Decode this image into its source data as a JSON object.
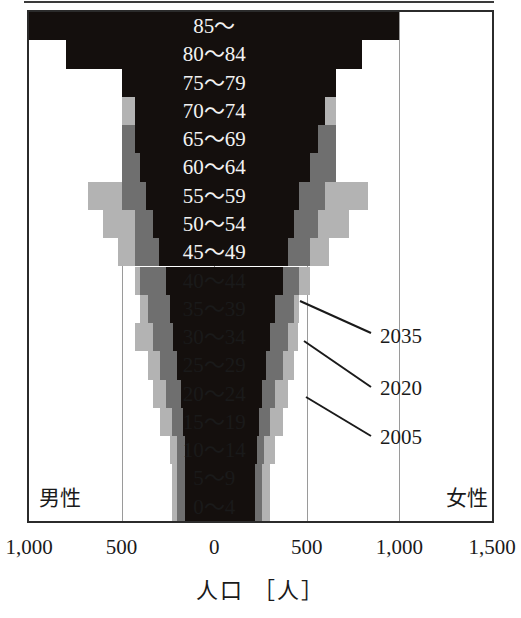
{
  "figure": {
    "axis_title": "人口 ［人］",
    "male_label": "男性",
    "female_label": "女性"
  },
  "axis": {
    "ticks": [
      {
        "label": "1,000",
        "value": -1000
      },
      {
        "label": "500",
        "value": -500
      },
      {
        "label": "0",
        "value": 0
      },
      {
        "label": "500",
        "value": 500
      },
      {
        "label": "1,000",
        "value": 1000
      },
      {
        "label": "1,500",
        "value": 1500
      }
    ],
    "gridlines": [
      -1000,
      -500,
      0,
      500,
      1000,
      1500
    ],
    "xmin": -1000,
    "xmax": 1500
  },
  "series_labels": [
    {
      "name": "2035",
      "color": "#140f0d"
    },
    {
      "name": "2020",
      "color": "#6f6f6f"
    },
    {
      "name": "2005",
      "color": "#b3b3b3"
    }
  ],
  "chart_data": {
    "type": "bar",
    "subtype": "population-pyramid",
    "title": "",
    "xlabel": "人口 ［人］",
    "ylabel": "",
    "xlim": [
      -1000,
      1500
    ],
    "grid": true,
    "legend_position": "inline-annotation",
    "categories": [
      "85〜",
      "80〜84",
      "75〜79",
      "70〜74",
      "65〜69",
      "60〜64",
      "55〜59",
      "50〜54",
      "45〜49",
      "40〜44",
      "35〜39",
      "30〜34",
      "25〜29",
      "20〜24",
      "15〜19",
      "10〜14",
      "5〜9",
      "0〜4"
    ],
    "series": [
      {
        "name": "2005",
        "color": "#b3b3b3",
        "male": [
          160,
          230,
          330,
          500,
          500,
          500,
          680,
          600,
          520,
          430,
          400,
          430,
          360,
          330,
          290,
          240,
          230,
          230
        ],
        "female": [
          370,
          360,
          520,
          660,
          660,
          660,
          830,
          730,
          620,
          520,
          460,
          450,
          430,
          400,
          370,
          330,
          300,
          300
        ]
      },
      {
        "name": "2020",
        "color": "#6f6f6f",
        "male": [
          160,
          230,
          330,
          430,
          500,
          500,
          500,
          430,
          430,
          400,
          360,
          330,
          290,
          260,
          230,
          200,
          200,
          200
        ],
        "female": [
          370,
          360,
          520,
          600,
          660,
          660,
          600,
          560,
          520,
          460,
          430,
          400,
          370,
          330,
          300,
          270,
          260,
          260
        ]
      },
      {
        "name": "2035",
        "color": "#140f0d",
        "male": [
          1000,
          800,
          500,
          430,
          430,
          400,
          370,
          330,
          300,
          260,
          240,
          220,
          200,
          180,
          170,
          160,
          160,
          160
        ],
        "female": [
          1000,
          800,
          660,
          600,
          560,
          520,
          460,
          430,
          400,
          370,
          330,
          300,
          280,
          260,
          240,
          230,
          220,
          220
        ]
      }
    ]
  },
  "annotations": [
    {
      "label": "2035",
      "x": 380,
      "y": 324
    },
    {
      "label": "2020",
      "x": 380,
      "y": 376
    },
    {
      "label": "2005",
      "x": 380,
      "y": 425
    }
  ]
}
